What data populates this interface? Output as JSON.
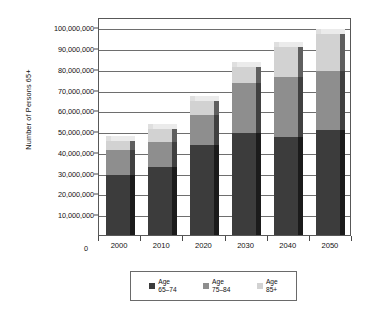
{
  "chart_data": {
    "type": "bar",
    "subtype": "stacked-column-3d",
    "title": "",
    "xlabel": "",
    "ylabel": "Number of Persons 65+",
    "categories": [
      "2000",
      "2010",
      "2020",
      "2030",
      "2040",
      "2050"
    ],
    "series": [
      {
        "name": "Age 65–74",
        "color": "#3c3c3c",
        "values": [
          29000000,
          33000000,
          43500000,
          49000000,
          47000000,
          50500000
        ]
      },
      {
        "name": "Age 75–84",
        "color": "#8e8e8e",
        "values": [
          12000000,
          12000000,
          14500000,
          24000000,
          29000000,
          28500000
        ]
      },
      {
        "name": "Age 85+",
        "color": "#d2d2d2",
        "values": [
          4500000,
          6000000,
          6500000,
          8000000,
          14500000,
          18000000
        ]
      }
    ],
    "totals": [
      45500000,
      51000000,
      64500000,
      81000000,
      90500000,
      97000000
    ],
    "ylim": [
      0,
      105000000
    ],
    "y_tick_values": [
      10000000,
      20000000,
      30000000,
      40000000,
      50000000,
      60000000,
      70000000,
      80000000,
      90000000,
      100000000
    ],
    "y_tick_labels": [
      "10,000,000",
      "20,000,000",
      "30,000,000",
      "40,000,000",
      "50,000,000",
      "60,000,000",
      "70,000,000",
      "80,000,000",
      "90,000,000",
      "100,000,000"
    ],
    "origin_label": "0",
    "grid": true,
    "grid_axis": "y",
    "legend_position": "bottom",
    "legend_entries": [
      {
        "label_line1": "Age",
        "label_line2": "65–74",
        "color": "#3c3c3c"
      },
      {
        "label_line1": "Age",
        "label_line2": "75–84",
        "color": "#8e8e8e"
      },
      {
        "label_line1": "Age",
        "label_line2": "85+",
        "color": "#d2d2d2"
      }
    ]
  },
  "colors": {
    "axis": "#585858",
    "grid": "#6e6e6e",
    "text": "#111111",
    "background": "#ffffff"
  }
}
